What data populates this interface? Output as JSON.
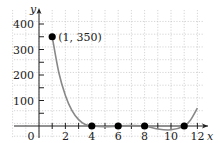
{
  "chart_data": {
    "type": "line",
    "title": "",
    "xlabel": "x",
    "ylabel": "y",
    "xlim": [
      -1.5,
      12.6
    ],
    "ylim": [
      -40,
      440
    ],
    "grid": true,
    "x_ticks": [
      0,
      2,
      4,
      6,
      8,
      10,
      12
    ],
    "x_tick_labels": [
      "0",
      "2",
      "4",
      "6",
      "8",
      "10",
      "12"
    ],
    "y_ticks": [
      100,
      200,
      300,
      400
    ],
    "y_tick_labels": [
      "100",
      "200",
      "300",
      "400"
    ],
    "series": [
      {
        "name": "curve",
        "x": [
          1,
          1.5,
          2,
          2.5,
          3,
          3.5,
          4,
          5,
          6,
          7,
          8,
          9,
          10,
          11,
          11.5,
          12
        ],
        "y": [
          350,
          210,
          120,
          60,
          25,
          6,
          0,
          -3,
          0,
          2,
          0,
          -12,
          -15,
          0,
          25,
          70
        ]
      }
    ],
    "points": [
      {
        "x": 1,
        "y": 350,
        "label": "(1, 350)"
      },
      {
        "x": 4,
        "y": 0
      },
      {
        "x": 6,
        "y": 0
      },
      {
        "x": 8,
        "y": 0
      },
      {
        "x": 11,
        "y": 0
      }
    ],
    "annotations": [
      {
        "text": "(1, 350)",
        "x": 1,
        "y": 350
      }
    ],
    "colors": {
      "curve": "#888888",
      "points": "#000000",
      "grid": "#bbbbbb",
      "axis": "#222222"
    }
  }
}
